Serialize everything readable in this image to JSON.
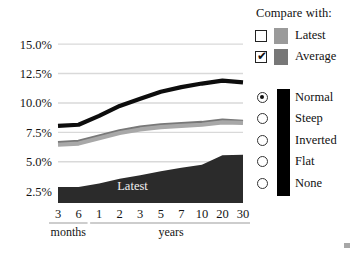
{
  "chart_data": {
    "type": "line",
    "title": "",
    "xlabel": "",
    "ylabel": "",
    "ylim": [
      1.5,
      16.2
    ],
    "grid": true,
    "legend_position": "right",
    "categories": [
      "3",
      "6",
      "1",
      "2",
      "3",
      "5",
      "7",
      "10",
      "20",
      "30"
    ],
    "category_groups": [
      {
        "label": "months",
        "members": [
          "3",
          "6"
        ]
      },
      {
        "label": "years",
        "members": [
          "1",
          "2",
          "3",
          "5",
          "7",
          "10",
          "20",
          "30"
        ]
      }
    ],
    "ytick_labels": [
      "15.0%",
      "12.5%",
      "10.0%",
      "7.5%",
      "5.0%",
      "2.5%"
    ],
    "ytick_values": [
      15.0,
      12.5,
      10.0,
      7.5,
      5.0,
      2.5
    ],
    "series": [
      {
        "name": "Normal",
        "style": "line",
        "color": "#0d0d0d",
        "values": [
          8.05,
          8.15,
          8.9,
          9.75,
          10.35,
          10.95,
          11.35,
          11.65,
          11.9,
          11.75
        ]
      },
      {
        "name": "Average",
        "style": "line",
        "color": "#787878",
        "values": [
          6.6,
          6.7,
          7.15,
          7.6,
          7.9,
          8.1,
          8.2,
          8.3,
          8.5,
          8.4
        ]
      },
      {
        "name": "Latest",
        "style": "line",
        "color": "#a8a8a8",
        "values": [
          6.45,
          6.55,
          7.0,
          7.45,
          7.75,
          7.95,
          8.05,
          8.15,
          8.35,
          8.3
        ]
      },
      {
        "name": "Latest",
        "style": "area",
        "color": "#2b2b2b",
        "label_in_area": "Latest",
        "values": [
          2.85,
          2.85,
          3.15,
          3.55,
          3.85,
          4.2,
          4.5,
          4.75,
          5.55,
          5.6
        ]
      }
    ]
  },
  "controls": {
    "compare_title": "Compare with:",
    "checkboxes": [
      {
        "label": "Latest",
        "checked": false,
        "check_glyph": "",
        "swatch_color": "#9a9a9a"
      },
      {
        "label": "Average",
        "checked": true,
        "check_glyph": "✔",
        "swatch_color": "#777777"
      }
    ],
    "radio_group": {
      "bar_color": "#000000",
      "options": [
        {
          "label": "Normal",
          "selected": true
        },
        {
          "label": "Steep",
          "selected": false
        },
        {
          "label": "Inverted",
          "selected": false
        },
        {
          "label": "Flat",
          "selected": false
        },
        {
          "label": "None",
          "selected": false
        }
      ]
    }
  }
}
